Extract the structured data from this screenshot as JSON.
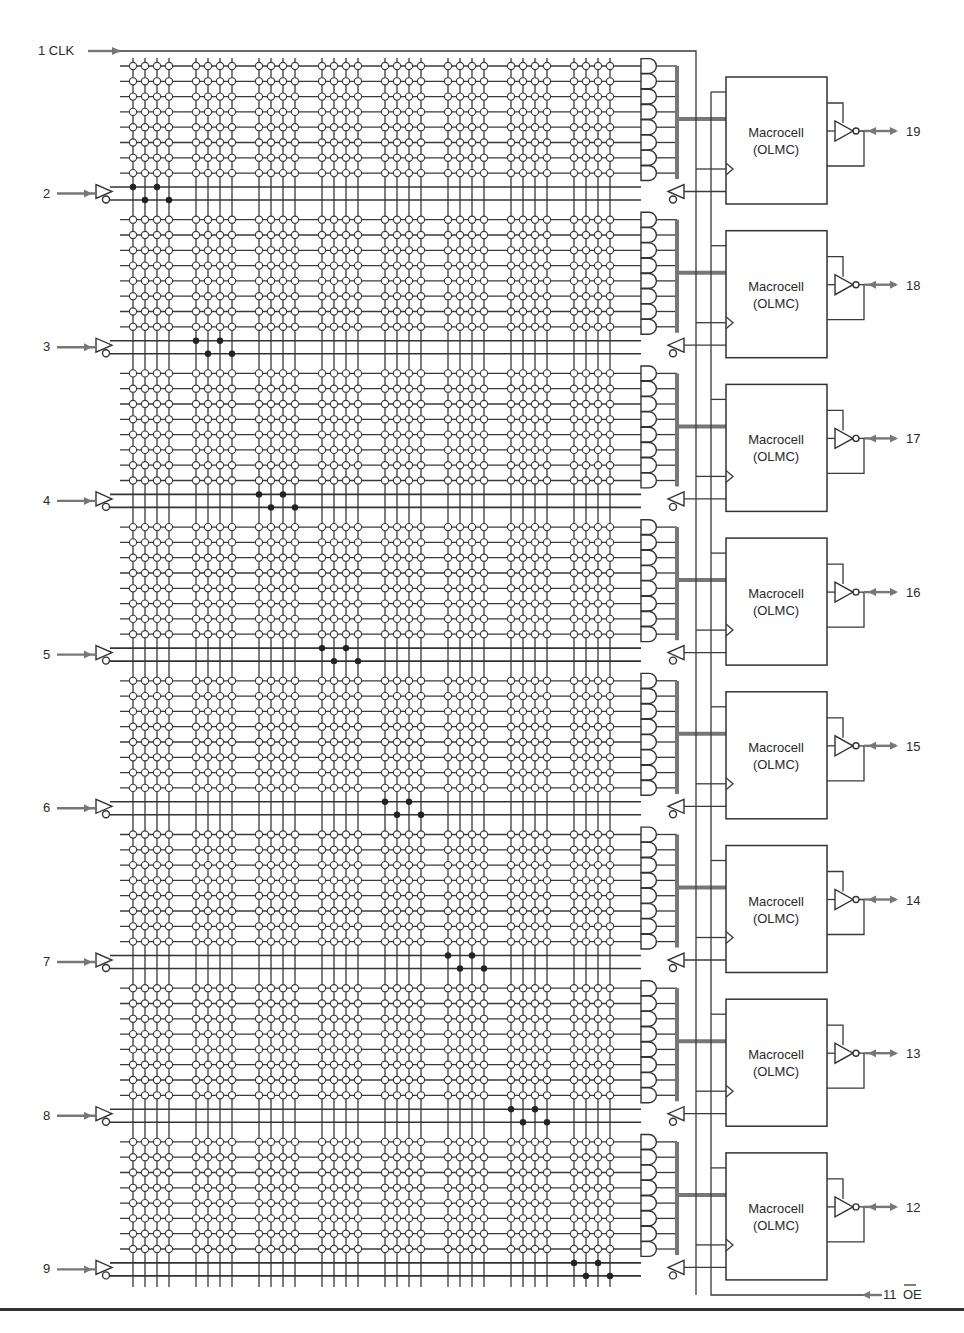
{
  "inputs": [
    {
      "pin": "1",
      "name": "CLK",
      "label": "1 CLK"
    },
    {
      "pin": "2",
      "label": "2"
    },
    {
      "pin": "3",
      "label": "3"
    },
    {
      "pin": "4",
      "label": "4"
    },
    {
      "pin": "5",
      "label": "5"
    },
    {
      "pin": "6",
      "label": "6"
    },
    {
      "pin": "7",
      "label": "7"
    },
    {
      "pin": "8",
      "label": "8"
    },
    {
      "pin": "9",
      "label": "9"
    }
  ],
  "oe_input": {
    "pin": "11",
    "name": "OE",
    "active_low": true,
    "label_pin": "11",
    "label_name": "OE"
  },
  "macrocells": [
    {
      "title": "Macrocell",
      "subtitle": "(OLMC)",
      "output_pin": "19"
    },
    {
      "title": "Macrocell",
      "subtitle": "(OLMC)",
      "output_pin": "18"
    },
    {
      "title": "Macrocell",
      "subtitle": "(OLMC)",
      "output_pin": "17"
    },
    {
      "title": "Macrocell",
      "subtitle": "(OLMC)",
      "output_pin": "16"
    },
    {
      "title": "Macrocell",
      "subtitle": "(OLMC)",
      "output_pin": "15"
    },
    {
      "title": "Macrocell",
      "subtitle": "(OLMC)",
      "output_pin": "14"
    },
    {
      "title": "Macrocell",
      "subtitle": "(OLMC)",
      "output_pin": "13"
    },
    {
      "title": "Macrocell",
      "subtitle": "(OLMC)",
      "output_pin": "12"
    }
  ],
  "array": {
    "product_terms_per_macrocell": 8,
    "column_groups": 8,
    "columns_per_group": 4
  },
  "colors": {
    "line": "#333333",
    "bus": "#777777",
    "arrow": "#777777",
    "background": "#ffffff"
  }
}
